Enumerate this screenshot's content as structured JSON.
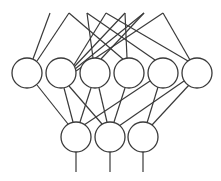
{
  "diagram": {
    "type": "neural-network",
    "stroke_color": "#3a3a3a",
    "background": "#ffffff",
    "node_radius": 15,
    "layers": [
      {
        "name": "hidden-layer",
        "nodes": [
          {
            "id": "h1",
            "x": 27,
            "y": 73
          },
          {
            "id": "h2",
            "x": 61,
            "y": 73
          },
          {
            "id": "h3",
            "x": 95,
            "y": 73
          },
          {
            "id": "h4",
            "x": 129,
            "y": 73
          },
          {
            "id": "h5",
            "x": 163,
            "y": 73
          },
          {
            "id": "h6",
            "x": 197,
            "y": 73
          }
        ]
      },
      {
        "name": "output-layer",
        "nodes": [
          {
            "id": "o1",
            "x": 76,
            "y": 137
          },
          {
            "id": "o2",
            "x": 110,
            "y": 137
          },
          {
            "id": "o3",
            "x": 143,
            "y": 137
          }
        ]
      }
    ],
    "input_edges": [
      {
        "x1": 50,
        "y1": 13,
        "x2": 33,
        "y2": 59
      },
      {
        "x1": 69,
        "y1": 13,
        "x2": 37,
        "y2": 61
      },
      {
        "x1": 69,
        "y1": 13,
        "x2": 124,
        "y2": 60
      },
      {
        "x1": 87,
        "y1": 13,
        "x2": 93,
        "y2": 58
      },
      {
        "x1": 87,
        "y1": 13,
        "x2": 155,
        "y2": 60
      },
      {
        "x1": 106,
        "y1": 13,
        "x2": 74,
        "y2": 65
      },
      {
        "x1": 106,
        "y1": 13,
        "x2": 188,
        "y2": 61
      },
      {
        "x1": 125,
        "y1": 13,
        "x2": 74,
        "y2": 67
      },
      {
        "x1": 125,
        "y1": 13,
        "x2": 127,
        "y2": 58
      },
      {
        "x1": 144,
        "y1": 13,
        "x2": 75,
        "y2": 69
      },
      {
        "x1": 144,
        "y1": 13,
        "x2": 101,
        "y2": 59
      },
      {
        "x1": 163,
        "y1": 13,
        "x2": 76,
        "y2": 71
      },
      {
        "x1": 163,
        "y1": 13,
        "x2": 190,
        "y2": 60
      }
    ],
    "hidden_to_output_edges": [
      {
        "x1": 37,
        "y1": 85,
        "x2": 68,
        "y2": 124
      },
      {
        "x1": 64,
        "y1": 88,
        "x2": 73,
        "y2": 122
      },
      {
        "x1": 69,
        "y1": 86,
        "x2": 102,
        "y2": 124
      },
      {
        "x1": 91,
        "y1": 88,
        "x2": 80,
        "y2": 122
      },
      {
        "x1": 99,
        "y1": 88,
        "x2": 107,
        "y2": 122
      },
      {
        "x1": 125,
        "y1": 88,
        "x2": 114,
        "y2": 122
      },
      {
        "x1": 150,
        "y1": 81,
        "x2": 84,
        "y2": 125
      },
      {
        "x1": 158,
        "y1": 87,
        "x2": 147,
        "y2": 123
      },
      {
        "x1": 184,
        "y1": 81,
        "x2": 119,
        "y2": 126
      },
      {
        "x1": 189,
        "y1": 85,
        "x2": 152,
        "y2": 125
      }
    ],
    "output_edges": [
      {
        "x1": 76,
        "y1": 152,
        "x2": 76,
        "y2": 172
      },
      {
        "x1": 110,
        "y1": 152,
        "x2": 110,
        "y2": 172
      },
      {
        "x1": 143,
        "y1": 152,
        "x2": 143,
        "y2": 172
      }
    ]
  }
}
